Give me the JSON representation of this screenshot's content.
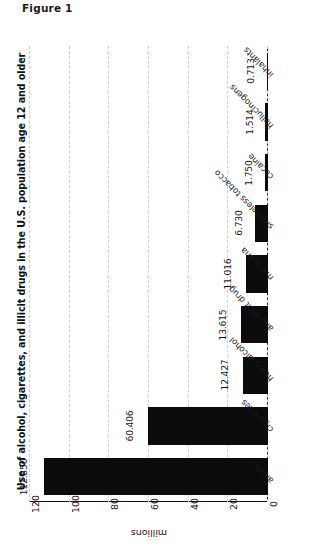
{
  "figure": {
    "caption": "Figure 1"
  },
  "chart_data": {
    "type": "bar",
    "orientation": "horizontal",
    "title": "Use of alcohol, cigarettes, and illicit drugs in the U.S. population age 12 and older",
    "xlabel": "millions",
    "ylabel": "",
    "categories": [
      "alcohol",
      "cigarettes",
      "heavy alcohol",
      "any illicit drug",
      "marijuana",
      "smokeless tobacco",
      "cocaine",
      "hallucinogens",
      "inhalants"
    ],
    "values": [
      112.85,
      60.406,
      12.427,
      13.615,
      11.016,
      6.73,
      1.75,
      1.514,
      0.713
    ],
    "value_labels": [
      "112.850",
      "60.406",
      "12.427",
      "13.615",
      "11.016",
      "6.730",
      "1.750",
      "1.514",
      "0.713"
    ],
    "ticks": [
      120,
      100,
      80,
      60,
      40,
      20,
      0
    ],
    "tick_labels": [
      "120",
      "100",
      "80",
      "60",
      "40",
      "20",
      "0"
    ],
    "xlim": [
      0,
      120
    ],
    "grid": true,
    "grid_style": "dashed",
    "legend": null,
    "bar_color": "#0b0b0b",
    "grid_color": "#cfcfcf",
    "axis_color": "#141414",
    "background": "#ffffff"
  }
}
